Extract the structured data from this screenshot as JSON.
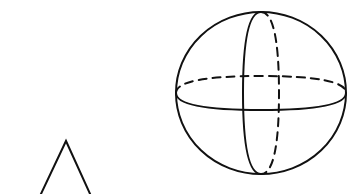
{
  "diagram": {
    "background": "#ffffff",
    "stroke_color": "#111111",
    "stroke_width": 2,
    "dash_pattern": "8 6",
    "shapes": [
      {
        "name": "sphere",
        "type": "sphere",
        "center": [
          261,
          93
        ],
        "radius_x": 85,
        "radius_y": 81,
        "equator": {
          "front_style": "solid",
          "back_style": "dashed",
          "front_depth_y": 110,
          "back_depth_y": 76
        },
        "meridian": {
          "front_style": "solid",
          "back_style": "dashed",
          "front_x": 243,
          "back_x": 279
        }
      },
      {
        "name": "cone",
        "type": "cone-partial",
        "apex": [
          66,
          141
        ],
        "left_base": [
          40,
          194
        ],
        "right_base": [
          90,
          194
        ]
      }
    ]
  }
}
